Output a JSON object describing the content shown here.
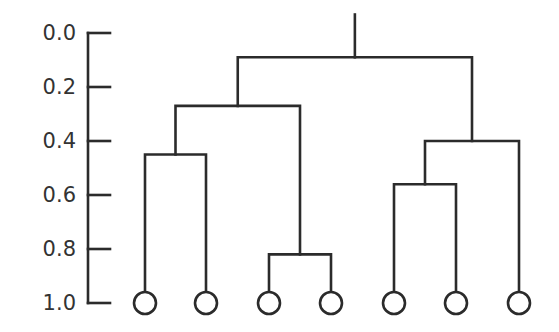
{
  "chart_data": {
    "type": "dendrogram",
    "title": "",
    "axis": {
      "orientation": "vertical",
      "range": [
        0.0,
        1.0
      ],
      "ticks": [
        "0.0",
        "0.2",
        "0.4",
        "0.6",
        "0.8",
        "1.0"
      ],
      "inverted": true
    },
    "leaves": [
      {
        "id": 1,
        "label": ""
      },
      {
        "id": 2,
        "label": ""
      },
      {
        "id": 3,
        "label": ""
      },
      {
        "id": 4,
        "label": ""
      },
      {
        "id": 5,
        "label": ""
      },
      {
        "id": 6,
        "label": ""
      },
      {
        "id": 7,
        "label": ""
      }
    ],
    "merges": [
      {
        "children": [
          "leaf3",
          "leaf4"
        ],
        "height": 0.82,
        "name": "A"
      },
      {
        "children": [
          "leaf1",
          "leaf2"
        ],
        "height": 0.45,
        "name": "B"
      },
      {
        "children": [
          "B",
          "A"
        ],
        "height": 0.27,
        "name": "C"
      },
      {
        "children": [
          "leaf5",
          "leaf6"
        ],
        "height": 0.56,
        "name": "D"
      },
      {
        "children": [
          "D",
          "leaf7"
        ],
        "height": 0.4,
        "name": "E"
      },
      {
        "children": [
          "C",
          "E"
        ],
        "height": 0.09,
        "name": "root"
      }
    ],
    "root_stem_top": -0.05
  },
  "layout": {
    "axis_x": 88,
    "tick_len": 22,
    "y0": 33,
    "y1": 303,
    "leaf_x": [
      145,
      206,
      269,
      331,
      394,
      456,
      519
    ],
    "leaf_radius": 11,
    "line_color": "#2b2b2b",
    "label_color": "#333333"
  }
}
